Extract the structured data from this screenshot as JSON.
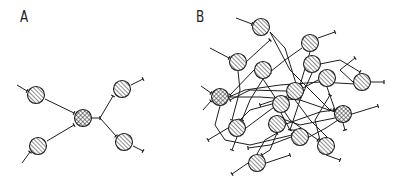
{
  "panels": [
    {
      "label": "A",
      "label_pos": [
        20,
        8
      ],
      "nodes": [
        {
          "x": 36,
          "y": 95,
          "fill": "hatch"
        },
        {
          "x": 83,
          "y": 118,
          "fill": "crosshatch"
        },
        {
          "x": 122,
          "y": 89,
          "fill": "hatch"
        },
        {
          "x": 38,
          "y": 146,
          "fill": "hatch"
        },
        {
          "x": 124,
          "y": 142,
          "fill": "hatch"
        }
      ],
      "edges": [
        [
          [
            17,
            85
          ],
          [
            27,
            91
          ]
        ],
        [
          [
            45,
            99
          ],
          [
            74,
            113
          ]
        ],
        [
          [
            22,
            163
          ],
          [
            30,
            152
          ]
        ],
        [
          [
            47,
            141
          ],
          [
            74,
            125
          ]
        ],
        [
          [
            92,
            118
          ],
          [
            100,
            118
          ]
        ],
        [
          [
            100,
            118
          ],
          [
            113,
            96
          ]
        ],
        [
          [
            100,
            118
          ],
          [
            116,
            136
          ]
        ],
        [
          [
            131,
            85
          ],
          [
            143,
            79
          ]
        ],
        [
          [
            133,
            146
          ],
          [
            143,
            151
          ]
        ]
      ],
      "terminals": [
        [
          30,
          93
        ],
        [
          72,
          112
        ],
        [
          32,
          151
        ],
        [
          75,
          124
        ],
        [
          113,
          96
        ],
        [
          116,
          136
        ]
      ]
    },
    {
      "label": "B",
      "label_pos": [
        196,
        8
      ],
      "nodes": [
        {
          "x": 261,
          "y": 27,
          "fill": "hatch"
        },
        {
          "x": 310,
          "y": 43,
          "fill": "hatch"
        },
        {
          "x": 238,
          "y": 62,
          "fill": "hatch"
        },
        {
          "x": 263,
          "y": 70,
          "fill": "hatch"
        },
        {
          "x": 312,
          "y": 64,
          "fill": "hatch"
        },
        {
          "x": 327,
          "y": 78,
          "fill": "hatch"
        },
        {
          "x": 362,
          "y": 82,
          "fill": "hatch"
        },
        {
          "x": 295,
          "y": 91,
          "fill": "hatch"
        },
        {
          "x": 220,
          "y": 97,
          "fill": "crosshatch"
        },
        {
          "x": 281,
          "y": 104,
          "fill": "hatch"
        },
        {
          "x": 343,
          "y": 114,
          "fill": "crosshatch"
        },
        {
          "x": 237,
          "y": 128,
          "fill": "hatch"
        },
        {
          "x": 277,
          "y": 124,
          "fill": "hatch"
        },
        {
          "x": 300,
          "y": 137,
          "fill": "hatch"
        },
        {
          "x": 326,
          "y": 146,
          "fill": "hatch"
        },
        {
          "x": 257,
          "y": 163,
          "fill": "hatch"
        }
      ],
      "edges": [
        [
          [
            236,
            18
          ],
          [
            252,
            24
          ]
        ],
        [
          [
            270,
            32
          ],
          [
            285,
            48
          ],
          [
            298,
            90
          ]
        ],
        [
          [
            270,
            32
          ],
          [
            290,
            70
          ],
          [
            330,
            110
          ]
        ],
        [
          [
            318,
            38
          ],
          [
            335,
            32
          ]
        ],
        [
          [
            302,
            48
          ],
          [
            285,
            60
          ],
          [
            270,
            72
          ]
        ],
        [
          [
            310,
            52
          ],
          [
            300,
            85
          ]
        ],
        [
          [
            210,
            48
          ],
          [
            229,
            58
          ]
        ],
        [
          [
            238,
            71
          ],
          [
            240,
            90
          ],
          [
            232,
            120
          ]
        ],
        [
          [
            246,
            62
          ],
          [
            270,
            40
          ]
        ],
        [
          [
            263,
            79
          ],
          [
            250,
            100
          ],
          [
            242,
            120
          ]
        ],
        [
          [
            263,
            79
          ],
          [
            290,
            120
          ],
          [
            318,
            140
          ]
        ],
        [
          [
            254,
            70
          ],
          [
            230,
            95
          ]
        ],
        [
          [
            320,
            64
          ],
          [
            340,
            60
          ],
          [
            360,
            72
          ]
        ],
        [
          [
            312,
            73
          ],
          [
            300,
            100
          ],
          [
            290,
            130
          ]
        ],
        [
          [
            327,
            87
          ],
          [
            335,
            110
          ]
        ],
        [
          [
            318,
            80
          ],
          [
            290,
            95
          ],
          [
            260,
            105
          ]
        ],
        [
          [
            353,
            82
          ],
          [
            340,
            70
          ],
          [
            355,
            58
          ]
        ],
        [
          [
            371,
            82
          ],
          [
            384,
            82
          ]
        ],
        [
          [
            295,
            100
          ],
          [
            310,
            120
          ],
          [
            330,
            140
          ]
        ],
        [
          [
            286,
            91
          ],
          [
            250,
            90
          ],
          [
            230,
            100
          ]
        ],
        [
          [
            229,
            97
          ],
          [
            260,
            97
          ],
          [
            300,
            100
          ],
          [
            335,
            112
          ]
        ],
        [
          [
            220,
            106
          ],
          [
            215,
            125
          ],
          [
            225,
            140
          ],
          [
            250,
            145
          ],
          [
            292,
            135
          ]
        ],
        [
          [
            281,
            113
          ],
          [
            290,
            130
          ],
          [
            300,
            130
          ]
        ],
        [
          [
            272,
            104
          ],
          [
            250,
            110
          ],
          [
            240,
            120
          ]
        ],
        [
          [
            352,
            114
          ],
          [
            378,
            106
          ]
        ],
        [
          [
            343,
            123
          ],
          [
            345,
            130
          ]
        ],
        [
          [
            335,
            118
          ],
          [
            300,
            125
          ],
          [
            280,
            118
          ]
        ],
        [
          [
            228,
            128
          ],
          [
            208,
            140
          ]
        ],
        [
          [
            237,
            137
          ],
          [
            232,
            150
          ]
        ],
        [
          [
            246,
            128
          ],
          [
            270,
            110
          ],
          [
            300,
            90
          ]
        ],
        [
          [
            277,
            133
          ],
          [
            270,
            150
          ],
          [
            262,
            155
          ]
        ],
        [
          [
            286,
            124
          ],
          [
            320,
            112
          ],
          [
            334,
            110
          ]
        ],
        [
          [
            309,
            137
          ],
          [
            326,
            128
          ],
          [
            338,
            120
          ]
        ],
        [
          [
            291,
            137
          ],
          [
            270,
            145
          ],
          [
            248,
            148
          ]
        ],
        [
          [
            326,
            155
          ],
          [
            340,
            160
          ]
        ],
        [
          [
            320,
            140
          ],
          [
            315,
            120
          ],
          [
            330,
            95
          ]
        ],
        [
          [
            248,
            163
          ],
          [
            232,
            174
          ]
        ],
        [
          [
            266,
            163
          ],
          [
            290,
            155
          ]
        ],
        [
          [
            257,
            154
          ],
          [
            265,
            140
          ],
          [
            277,
            133
          ]
        ],
        [
          [
            201,
            86
          ],
          [
            211,
            93
          ]
        ],
        [
          [
            203,
            110
          ],
          [
            211,
            101
          ]
        ],
        [
          [
            229,
            97
          ],
          [
            245,
            90
          ],
          [
            280,
            85
          ],
          [
            320,
            82
          ],
          [
            355,
            84
          ]
        ]
      ]
    }
  ],
  "colors": {
    "stroke": "#1e1e1e",
    "background": "#ffffff"
  }
}
